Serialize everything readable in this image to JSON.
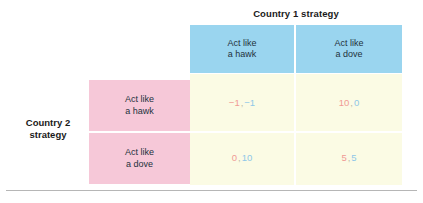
{
  "figure": {
    "column_group_title": "Country 1 strategy",
    "row_group_title_line1": "Country 2",
    "row_group_title_line2": "strategy",
    "column_headers": [
      {
        "line1": "Act like",
        "line2": "a hawk"
      },
      {
        "line1": "Act like",
        "line2": "a dove"
      }
    ],
    "row_headers": [
      {
        "line1": "Act like",
        "line2": "a hawk"
      },
      {
        "line1": "Act like",
        "line2": "a dove"
      }
    ],
    "cells": [
      [
        {
          "payoff_a": "−1",
          "separator": ",",
          "payoff_b": "−1"
        },
        {
          "payoff_a": "10",
          "separator": ",",
          "payoff_b": "0"
        }
      ],
      [
        {
          "payoff_a": "0",
          "separator": ",",
          "payoff_b": "10"
        },
        {
          "payoff_a": "5",
          "separator": ",",
          "payoff_b": "5"
        }
      ]
    ],
    "colors": {
      "column_header_blue": "#9ad5ef",
      "row_header_pink": "#f6c8d8",
      "cell_cream": "#fbfbe4",
      "payoff_a_pink": "#f09a94",
      "payoff_b_blue": "#8fc7e8",
      "rule_gray": "#b6b6b6"
    }
  },
  "chart_data": {
    "type": "table",
    "xlabel": "Country 1 strategy",
    "ylabel": "Country 2 strategy",
    "categories": [
      "Act like a hawk",
      "Act like a dove"
    ],
    "row_categories": [
      "Act like a hawk",
      "Act like a dove"
    ],
    "column_categories": [
      "Act like a hawk",
      "Act like a dove"
    ],
    "cells": [
      [
        {
          "row": "Act like a hawk",
          "column": "Act like a hawk",
          "payoff_country2": -1,
          "payoff_country1": -1,
          "label": "−1, −1"
        },
        {
          "row": "Act like a hawk",
          "column": "Act like a dove",
          "payoff_country2": 10,
          "payoff_country1": 0,
          "label": "10, 0"
        }
      ],
      [
        {
          "row": "Act like a dove",
          "column": "Act like a hawk",
          "payoff_country2": 0,
          "payoff_country1": 10,
          "label": "0, 10"
        },
        {
          "row": "Act like a dove",
          "column": "Act like a dove",
          "payoff_country2": 5,
          "payoff_country1": 5,
          "label": "5, 5"
        }
      ]
    ],
    "grid": true,
    "legend": "none"
  }
}
